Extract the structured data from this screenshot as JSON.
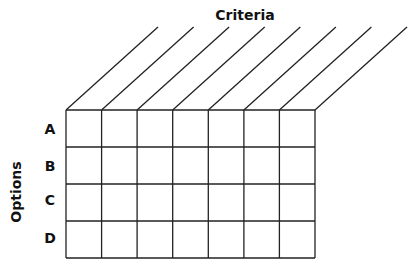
{
  "diagram": {
    "criteria_label": "Criteria",
    "options_label": "Options",
    "rows": [
      "A",
      "B",
      "C",
      "D"
    ],
    "columns_count": 7,
    "line_color": "#222222"
  }
}
